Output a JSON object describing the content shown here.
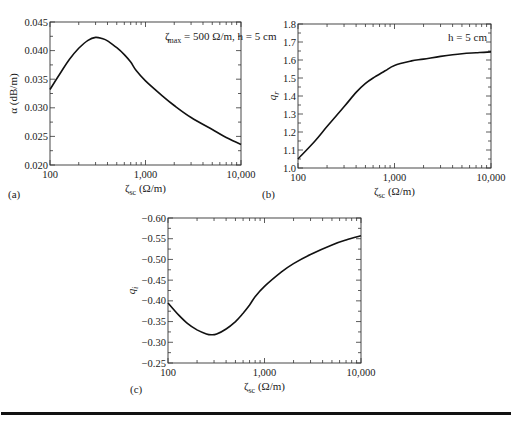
{
  "chart_data": [
    {
      "panel": "(a)",
      "type": "line",
      "title": "",
      "annotation": "ζmax = 500 Ω/m, h = 5 cm",
      "xlabel": "ζsc (Ω/m)",
      "ylabel": "α (dB/m)",
      "xscale": "log",
      "xlim": [
        100,
        10000
      ],
      "ylim": [
        0.02,
        0.045
      ],
      "xticks": [
        "100",
        "1,000",
        "10,000"
      ],
      "yticks": [
        "0.020",
        "0.025",
        "0.030",
        "0.035",
        "0.040",
        "0.045"
      ],
      "grid": false,
      "x": [
        100,
        130,
        160,
        200,
        250,
        300,
        350,
        400,
        500,
        600,
        700,
        800,
        1000,
        1500,
        2000,
        3000,
        5000,
        7000,
        10000
      ],
      "y": [
        0.0332,
        0.0362,
        0.0385,
        0.0404,
        0.0418,
        0.0423,
        0.0421,
        0.0417,
        0.0405,
        0.0393,
        0.038,
        0.0365,
        0.0347,
        0.0321,
        0.0304,
        0.0283,
        0.0262,
        0.0248,
        0.0236
      ]
    },
    {
      "panel": "(b)",
      "type": "line",
      "title": "",
      "annotation": "h = 5 cm",
      "xlabel": "ζsc (Ω/m)",
      "ylabel": "qr",
      "xscale": "log",
      "xlim": [
        100,
        10000
      ],
      "ylim": [
        1.0,
        1.8
      ],
      "xticks": [
        "100",
        "1,000",
        "10,000"
      ],
      "yticks": [
        "1.0",
        "1.1",
        "1.2",
        "1.3",
        "1.4",
        "1.5",
        "1.6",
        "1.7",
        "1.8"
      ],
      "grid": false,
      "x": [
        100,
        150,
        200,
        300,
        400,
        500,
        600,
        800,
        1000,
        1500,
        2000,
        3000,
        5000,
        7000,
        10000
      ],
      "y": [
        1.05,
        1.15,
        1.23,
        1.34,
        1.42,
        1.47,
        1.5,
        1.54,
        1.57,
        1.595,
        1.605,
        1.62,
        1.635,
        1.64,
        1.645
      ]
    },
    {
      "panel": "(c)",
      "type": "line",
      "title": "",
      "xlabel": "ζsc (Ω/m)",
      "ylabel": "qi",
      "xscale": "log",
      "xlim": [
        100,
        10000
      ],
      "ylim": [
        -0.6,
        -0.25
      ],
      "xticks": [
        "100",
        "1,000",
        "10,000"
      ],
      "yticks": [
        "-0.25",
        "-0.30",
        "-0.35",
        "-0.40",
        "-0.45",
        "-0.50",
        "-0.55",
        "-0.60"
      ],
      "grid": false,
      "x": [
        100,
        130,
        160,
        200,
        250,
        280,
        320,
        400,
        500,
        600,
        700,
        800,
        1000,
        1500,
        2000,
        3000,
        5000,
        7000,
        10000
      ],
      "y": [
        -0.455,
        -0.485,
        -0.505,
        -0.52,
        -0.53,
        -0.532,
        -0.53,
        -0.518,
        -0.5,
        -0.48,
        -0.46,
        -0.44,
        -0.415,
        -0.38,
        -0.36,
        -0.338,
        -0.315,
        -0.303,
        -0.293
      ]
    }
  ],
  "labels": {
    "panel_a": "(a)",
    "panel_b": "(b)",
    "panel_c": "(c)",
    "annot_a_zeta": "ζ",
    "annot_a_sub": "max",
    "annot_a_rest": " = 500 Ω/m, h = 5 cm",
    "annot_b": "h = 5 cm",
    "xlabel_zeta": "ζ",
    "xlabel_sub": "sc",
    "xlabel_unit": " (Ω/m)",
    "ylabel_a": "α (dB/m)",
    "ylabel_b_main": "q",
    "ylabel_b_sub": "r",
    "ylabel_c_main": "q",
    "ylabel_c_sub": "i"
  }
}
